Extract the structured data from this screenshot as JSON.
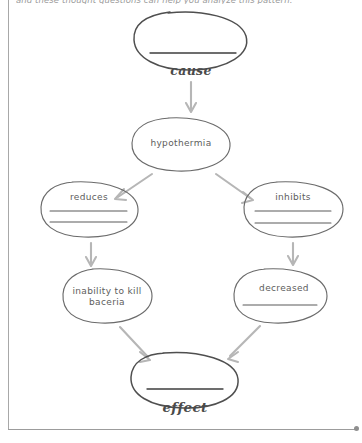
{
  "page": {
    "background_color": "#ffffff",
    "frame_color": "#a8a8a8"
  },
  "instruction": {
    "text": "and these thought questions can help you analyze this pattern.",
    "clipped": true
  },
  "diagram": {
    "type": "cause-effect-concept-map",
    "ink_color": "#6b6b6b",
    "arrow_color": "#b4b4b4",
    "labels": {
      "cause": "cause",
      "effect": "effect"
    },
    "nodes": [
      {
        "id": "cause-node",
        "name": "cause-oval",
        "text": "",
        "blank_lines": 1,
        "cx": 191,
        "cy": 40,
        "rx": 57,
        "ry": 29
      },
      {
        "id": "hypothermia-node",
        "name": "hypothermia-oval",
        "text": "hypothermia",
        "blank_lines": 0,
        "cx": 181,
        "cy": 144,
        "rx": 49,
        "ry": 26
      },
      {
        "id": "reduces-node",
        "name": "reduces-oval",
        "text": "reduces",
        "blank_lines": 2,
        "cx": 89,
        "cy": 209,
        "rx": 49,
        "ry": 28
      },
      {
        "id": "inhibits-node",
        "name": "inhibits-oval",
        "text": "inhibits",
        "blank_lines": 2,
        "cx": 293,
        "cy": 209,
        "rx": 50,
        "ry": 28
      },
      {
        "id": "inability-node",
        "name": "inability-to-kill-bacteria-oval",
        "text": "inability to kill baceria",
        "text_lines": [
          "inability to kill",
          "baceria"
        ],
        "blank_lines": 0,
        "cx": 107,
        "cy": 296,
        "rx": 45,
        "ry": 28
      },
      {
        "id": "decreased-node",
        "name": "decreased-oval",
        "text": "decreased",
        "blank_lines": 1,
        "cx": 280,
        "cy": 296,
        "rx": 47,
        "ry": 28
      },
      {
        "id": "effect-node",
        "name": "effect-oval",
        "text": "",
        "blank_lines": 1,
        "cx": 184,
        "cy": 380,
        "rx": 54,
        "ry": 28
      }
    ],
    "arrows": [
      {
        "name": "arrow-cause-to-hypothermia",
        "from": "cause-node",
        "to": "hypothermia-node",
        "direction": "down"
      },
      {
        "name": "arrow-hypothermia-to-reduces",
        "from": "hypothermia-node",
        "to": "reduces-node",
        "direction": "down-left"
      },
      {
        "name": "arrow-hypothermia-to-inhibits",
        "from": "hypothermia-node",
        "to": "inhibits-node",
        "direction": "down-right"
      },
      {
        "name": "arrow-reduces-to-inability",
        "from": "reduces-node",
        "to": "inability-node",
        "direction": "down"
      },
      {
        "name": "arrow-inhibits-to-decreased",
        "from": "inhibits-node",
        "to": "decreased-node",
        "direction": "down"
      },
      {
        "name": "arrow-inability-to-effect",
        "from": "inability-node",
        "to": "effect-node",
        "direction": "down-right"
      },
      {
        "name": "arrow-decreased-to-effect",
        "from": "decreased-node",
        "to": "effect-node",
        "direction": "down-left"
      }
    ]
  }
}
